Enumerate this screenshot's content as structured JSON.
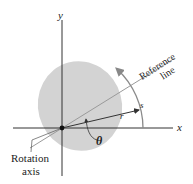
{
  "diagram": {
    "type": "rotation-reference-diagram",
    "labels": {
      "x_axis": "x",
      "y_axis": "y",
      "reference_line_1": "Reference",
      "reference_line_2": "line",
      "radius": "r",
      "arc_length": "s",
      "angle": "θ",
      "rotation_axis_1": "Rotation",
      "rotation_axis_2": "axis"
    },
    "colors": {
      "body_fill": "#d3d3d3",
      "axis": "#333333",
      "reference_line": "#9a9a9a",
      "radius_arrow": "#333333",
      "arc": "#8a8a8a",
      "origin_dot": "#111111"
    },
    "geometry": {
      "origin": [
        62,
        128
      ],
      "ellipse": {
        "cx": 80,
        "cy": 106,
        "rx": 42,
        "ry": 45,
        "rotate": -15
      },
      "reference_angle_deg": 32,
      "radius_angle_deg": 14
    }
  }
}
